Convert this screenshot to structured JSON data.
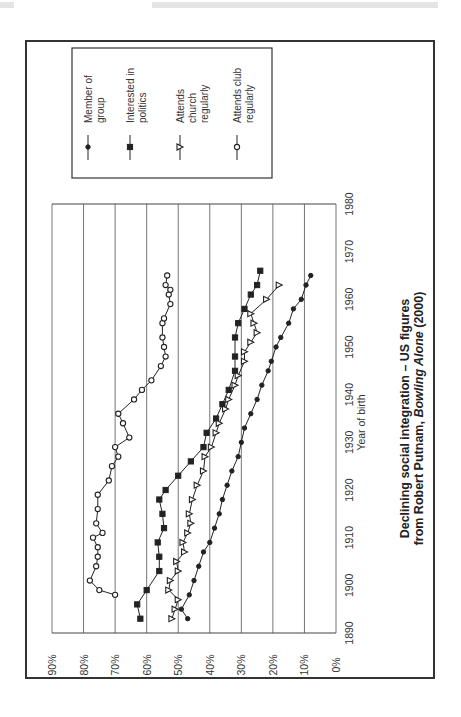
{
  "page": {
    "orientation": "rotated 90deg counter-clockwise (landscape figure on portrait page)"
  },
  "figure": {
    "caption_line1": "Declining social integration – US figures",
    "caption_line2_prefix": "from Robert Putnam, ",
    "caption_line2_italic": "Bowling Alone",
    "caption_line2_suffix": " (2000)"
  },
  "legend": {
    "items": [
      {
        "label_lines": [
          "Member of",
          "group"
        ],
        "marker": "filled-circle"
      },
      {
        "label_lines": [
          "Interested in",
          "politics"
        ],
        "marker": "filled-square"
      },
      {
        "label_lines": [
          "Attends",
          "church",
          "regularly"
        ],
        "marker": "open-triangle"
      },
      {
        "label_lines": [
          "Attends club",
          "regularly"
        ],
        "marker": "open-circle"
      }
    ]
  },
  "chart_data": {
    "type": "line",
    "xlabel": "Year of birth",
    "ylabel": "",
    "xlim": [
      1890,
      1980
    ],
    "ylim": [
      0,
      90
    ],
    "x_ticks": [
      "1890",
      "1900",
      "1910",
      "1920",
      "1930",
      "1940",
      "1950",
      "1960",
      "1970",
      "1980"
    ],
    "y_ticks": [
      "0%",
      "10%",
      "20%",
      "30%",
      "40%",
      "50%",
      "60%",
      "70%",
      "80%",
      "90%"
    ],
    "grid": "horizontal lines at each 10% (rendered vertical due to rotation)",
    "legend_position": "right (top of page, rotated)",
    "series": [
      {
        "name": "Member of group",
        "marker": "filled-circle",
        "x": [
          1893,
          1895,
          1898,
          1901,
          1904,
          1907,
          1909,
          1912,
          1915,
          1918,
          1921,
          1924,
          1927,
          1930,
          1933,
          1936,
          1939,
          1942,
          1945,
          1947,
          1950,
          1952,
          1955,
          1958,
          1960,
          1963,
          1965
        ],
        "values": [
          47,
          49,
          46.5,
          45,
          43.5,
          42,
          40,
          38.5,
          37,
          36,
          34.5,
          33,
          31,
          30,
          29,
          27,
          25,
          23.5,
          21.5,
          20.5,
          19,
          17.5,
          15,
          13.5,
          11,
          9.5,
          8
        ]
      },
      {
        "name": "Interested in politics",
        "marker": "filled-square",
        "x": [
          1893,
          1896,
          1899,
          1903,
          1906,
          1909,
          1912,
          1915,
          1918,
          1920,
          1923,
          1926,
          1929,
          1932,
          1935,
          1938,
          1941,
          1945,
          1948,
          1952,
          1955,
          1958,
          1961,
          1963,
          1966
        ],
        "values": [
          62,
          63,
          60,
          56,
          56,
          56.5,
          54.5,
          55,
          56,
          54,
          50,
          46,
          42,
          41,
          38,
          36,
          34,
          32,
          32,
          32,
          31,
          29,
          27,
          25,
          24
        ]
      },
      {
        "name": "Attends church regularly",
        "marker": "open-triangle",
        "x": [
          1893,
          1895,
          1897,
          1899,
          1901,
          1903,
          1905,
          1907,
          1909,
          1911,
          1913,
          1915,
          1918,
          1921,
          1924,
          1927,
          1929,
          1932,
          1934,
          1937,
          1939,
          1942,
          1944,
          1947,
          1949,
          1951,
          1953,
          1955,
          1957,
          1960,
          1963
        ],
        "values": [
          52,
          51,
          50,
          53,
          52.5,
          50,
          50.5,
          48,
          48.5,
          47,
          46,
          46.5,
          45.5,
          44,
          42,
          41.5,
          39.5,
          38,
          37,
          35,
          34,
          32,
          31,
          29,
          29,
          27,
          25,
          26,
          27,
          22,
          18
        ]
      },
      {
        "name": "Attends club regularly",
        "marker": "open-circle",
        "x": [
          1898,
          1899,
          1901,
          1904,
          1906,
          1908,
          1910,
          1911,
          1913,
          1916,
          1919,
          1922,
          1925,
          1927,
          1929,
          1931,
          1934,
          1936,
          1939,
          1941,
          1943,
          1946,
          1948,
          1950,
          1952,
          1955,
          1956,
          1959,
          1961,
          1962,
          1963,
          1965
        ],
        "values": [
          70,
          75,
          78,
          76,
          75.5,
          75.5,
          77,
          74,
          76,
          75.5,
          75.5,
          72,
          71,
          69,
          70,
          65.5,
          67.5,
          69,
          64,
          61.5,
          58.5,
          55.5,
          54,
          54.5,
          55,
          55,
          54.5,
          52.5,
          53,
          52.5,
          54,
          53.5
        ]
      }
    ]
  }
}
